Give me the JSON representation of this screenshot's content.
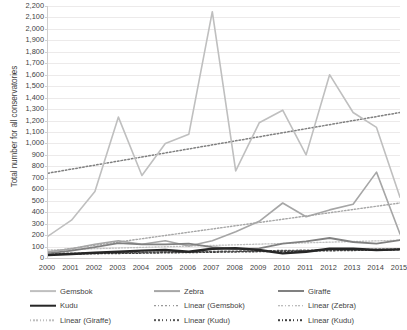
{
  "chart_data": {
    "type": "line",
    "title": "",
    "xlabel": "",
    "ylabel": "Total number for all conservatories",
    "x": [
      2000,
      2001,
      2002,
      2003,
      2004,
      2005,
      2006,
      2007,
      2008,
      2009,
      2010,
      2011,
      2012,
      2013,
      2014,
      2015
    ],
    "categories": [
      "2000",
      "2001",
      "2002",
      "2003",
      "2004",
      "2005",
      "2006",
      "2007",
      "2008",
      "2009",
      "2010",
      "2011",
      "2012",
      "2013",
      "2014",
      "2015"
    ],
    "ylim": [
      0,
      2200
    ],
    "ytick_step": 100,
    "yticks": [
      "0",
      "100",
      "200",
      "300",
      "400",
      "500",
      "600",
      "700",
      "800",
      "900",
      "1,000",
      "1,100",
      "1,200",
      "1,300",
      "1,400",
      "1,500",
      "1,600",
      "1,700",
      "1,800",
      "1,900",
      "2,000",
      "2,100",
      "2,200"
    ],
    "grid": true,
    "legend_position": "bottom",
    "series": [
      {
        "name": "Gemsbok",
        "color": "#bfbfbf",
        "style": "solid",
        "width": 1.6,
        "values": [
          190,
          330,
          580,
          1230,
          720,
          1000,
          1080,
          2150,
          760,
          1180,
          1290,
          900,
          1600,
          1270,
          1140,
          530
        ]
      },
      {
        "name": "Zebra",
        "color": "#a6a6a6",
        "style": "solid",
        "width": 1.6,
        "values": [
          55,
          80,
          120,
          150,
          120,
          150,
          105,
          150,
          230,
          320,
          480,
          360,
          420,
          470,
          750,
          210
        ]
      },
      {
        "name": "Giraffe",
        "color": "#808080",
        "style": "solid",
        "width": 1.8,
        "values": [
          40,
          65,
          95,
          130,
          120,
          120,
          125,
          95,
          80,
          85,
          125,
          145,
          175,
          140,
          125,
          155
        ]
      },
      {
        "name": "Kudu",
        "color": "#262626",
        "style": "solid",
        "width": 2.4,
        "values": [
          25,
          35,
          45,
          55,
          65,
          70,
          55,
          80,
          85,
          70,
          40,
          55,
          80,
          80,
          70,
          75
        ]
      }
    ],
    "trendlines": [
      {
        "name": "Linear (Gemsbok)",
        "color": "#7f7f7f",
        "style": "dotted",
        "width": 1.5,
        "y_start": 740,
        "y_end": 1270
      },
      {
        "name": "Linear (Zebra)",
        "color": "#a6a6a6",
        "style": "dotted",
        "width": 1.4,
        "y_start": 55,
        "y_end": 480
      },
      {
        "name": "Linear (Giraffe)",
        "color": "#bfbfbf",
        "style": "dotted",
        "width": 1.3,
        "y_start": 70,
        "y_end": 155
      },
      {
        "name": "Linear (Kudu)",
        "color": "#595959",
        "style": "dotted",
        "width": 1.6,
        "y_start": 38,
        "y_end": 78
      },
      {
        "name": "Linear (Kudu)",
        "color": "#404040",
        "style": "dotted",
        "width": 1.5,
        "y_start": 32,
        "y_end": 72
      }
    ]
  },
  "legend": {
    "items": [
      {
        "label": "Gemsbok",
        "color": "#bfbfbf",
        "style": "solid",
        "width": 1.8
      },
      {
        "label": "Zebra",
        "color": "#a6a6a6",
        "style": "solid",
        "width": 1.8
      },
      {
        "label": "Giraffe",
        "color": "#808080",
        "style": "solid",
        "width": 2.0
      },
      {
        "label": "Kudu",
        "color": "#262626",
        "style": "solid",
        "width": 2.6
      },
      {
        "label": "Linear (Gemsbok)",
        "color": "#7f7f7f",
        "style": "dotted",
        "width": 1.6
      },
      {
        "label": "Linear (Zebra)",
        "color": "#a6a6a6",
        "style": "dotted",
        "width": 1.5
      },
      {
        "label": "Linear (Giraffe)",
        "color": "#bfbfbf",
        "style": "dotted",
        "width": 1.4
      },
      {
        "label": "Linear (Kudu)",
        "color": "#595959",
        "style": "dotted",
        "width": 1.7
      },
      {
        "label": "Linear (Kudu)",
        "color": "#404040",
        "style": "dotted",
        "width": 1.6
      }
    ]
  },
  "colors": {
    "gridline": "#eceaea",
    "axis": "#d0cece",
    "text": "#3f3f3f",
    "background": "#ffffff"
  }
}
